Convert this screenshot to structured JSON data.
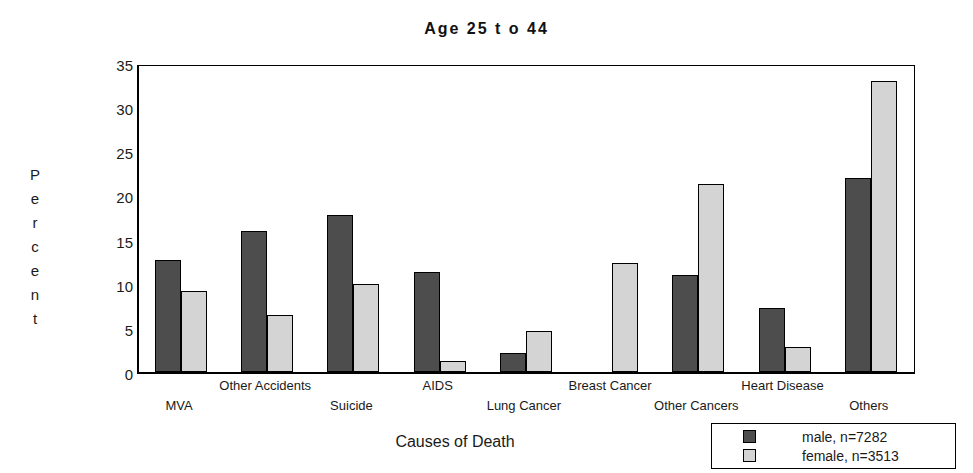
{
  "chart_data": {
    "type": "bar",
    "title": "Age  25  t o  44",
    "xlabel": "Causes of Death",
    "ylabel": "Percent",
    "ylim": [
      0,
      35
    ],
    "yticks": [
      0,
      5,
      10,
      15,
      20,
      25,
      30,
      35
    ],
    "grid": false,
    "legend_position": "bottom-right",
    "categories": [
      "MVA",
      "Other Accidents",
      "Suicide",
      "AIDS",
      "Lung Cancer",
      "Breast Cancer",
      "Other Cancers",
      "Heart Disease",
      "Others"
    ],
    "series": [
      {
        "name": "male, n=7282",
        "color": "#4d4d4d",
        "values": [
          12.7,
          16.0,
          17.8,
          11.3,
          2.2,
          0,
          11.0,
          7.2,
          22.0
        ]
      },
      {
        "name": "female, n=3513",
        "color": "#d4d4d4",
        "values": [
          9.2,
          6.5,
          10.0,
          1.2,
          4.6,
          12.3,
          21.3,
          2.8,
          33.0
        ]
      }
    ]
  },
  "y_axis_label_letters": [
    "P",
    "e",
    "r",
    "c",
    "e",
    "n",
    "t"
  ]
}
